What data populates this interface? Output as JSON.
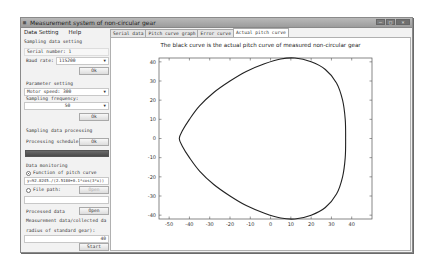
{
  "window": {
    "title": "Measurement system of non-circular gear",
    "controls": [
      "minimize",
      "maximize",
      "close"
    ]
  },
  "menu": {
    "items": [
      {
        "label": "Data Setting"
      },
      {
        "label": "Help"
      }
    ]
  },
  "left_panel": {
    "sampling": {
      "section_label": "Sampling data setting",
      "serial_number_label": "Serial number:",
      "serial_number_value": "1",
      "baud_rate_label": "Baud rate:",
      "baud_rate_value": "115200",
      "ok_label": "Ok"
    },
    "parameter": {
      "section_label": "Parameter setting",
      "motor_speed_value": "Motor speed: 300",
      "sampling_frequency_label": "Sampling frequency:",
      "sampling_frequency_value": "50",
      "ok_label": "Ok"
    },
    "processing": {
      "section_label": "Sampling data processing",
      "schedule_label": "Processing schedule:",
      "ok_label": "Ok",
      "progress_percent": 100
    },
    "monitoring": {
      "section_label": "Data monitoring",
      "function_radio_label": "Function of pitch curve",
      "function_value": "y=92.8245./(2.5180+0.1*cos(3*x))",
      "file_radio_label": "File path:",
      "open_label": "Open",
      "file_path_value": ""
    },
    "processed": {
      "label": "Processed data",
      "open_label": "Open",
      "measurement_label": "Measurement data/collected da",
      "radius_label": "radius of standard gear):",
      "radius_value": "40",
      "start_label": "Start"
    }
  },
  "tabs": [
    {
      "label": "Serial data",
      "active": false
    },
    {
      "label": "Pitch curve graph",
      "active": false
    },
    {
      "label": "Error curve",
      "active": false
    },
    {
      "label": "Actual pitch curve",
      "active": true
    }
  ],
  "chart_data": {
    "type": "line",
    "title": "The black curve is the actual pitch curve of measured non-circular gear",
    "xlabel": "",
    "ylabel": "",
    "xlim": [
      -55,
      50
    ],
    "ylim": [
      -42,
      42
    ],
    "x_ticks": [
      -50,
      -40,
      -30,
      -20,
      -10,
      0,
      10,
      20,
      30,
      40
    ],
    "y_ticks": [
      -40,
      -30,
      -20,
      -10,
      0,
      10,
      20,
      30,
      40
    ],
    "grid": false,
    "series": [
      {
        "name": "actual pitch curve",
        "color": "#222222",
        "closed": true,
        "x": [
          37,
          36.8,
          35.5,
          32.5,
          27,
          20,
          12,
          5,
          -3,
          -12,
          -20,
          -28,
          -35,
          -40,
          -43.5,
          -45,
          -43.5,
          -40,
          -35,
          -28,
          -20,
          -12,
          -3,
          5,
          12,
          20,
          27,
          32.5,
          35.5,
          36.8,
          37
        ],
        "y": [
          0,
          10,
          20,
          29,
          36,
          40,
          42,
          41.5,
          39,
          35,
          30,
          24,
          17,
          10,
          4,
          0,
          -4,
          -10,
          -17,
          -24,
          -30,
          -35,
          -39,
          -41.5,
          -42,
          -40,
          -36,
          -29,
          -20,
          -10,
          0
        ]
      }
    ]
  }
}
